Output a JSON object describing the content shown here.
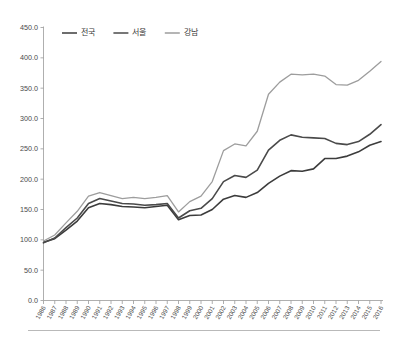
{
  "chart_data": {
    "type": "line",
    "title": "",
    "subtitle": "",
    "xlabel": "",
    "ylabel": "",
    "grid": false,
    "legend_position": "top-center",
    "ylim": [
      0.0,
      450.0
    ],
    "ytick_labels": [
      "0.0",
      "50.0",
      "100.0",
      "150.0",
      "200.0",
      "250.0",
      "300.0",
      "350.0",
      "400.0",
      "450.0"
    ],
    "ytick_values": [
      0,
      50,
      100,
      150,
      200,
      250,
      300,
      350,
      400,
      450
    ],
    "categories": [
      "1986",
      "1987",
      "1988",
      "1989",
      "1990",
      "1991",
      "1992",
      "1993",
      "1994",
      "1995",
      "1996",
      "1997",
      "1998",
      "1999",
      "2000",
      "2001",
      "2002",
      "2003",
      "2004",
      "2005",
      "2006",
      "2007",
      "2008",
      "2009",
      "2010",
      "2011",
      "2012",
      "2013",
      "2014",
      "2015",
      "2016"
    ],
    "series": [
      {
        "name": "전국",
        "color": "#3c3c3c",
        "width": 1.6,
        "values": [
          96,
          102,
          116,
          131,
          153,
          160,
          158,
          155,
          154,
          153,
          155,
          157,
          133,
          140,
          141,
          150,
          167,
          173,
          170,
          178,
          193,
          205,
          214,
          213,
          217,
          234,
          234,
          238,
          245,
          256,
          262
        ]
      },
      {
        "name": "서울",
        "color": "#4a4a4a",
        "width": 1.6,
        "values": [
          95,
          103,
          120,
          136,
          160,
          168,
          164,
          160,
          159,
          157,
          158,
          160,
          136,
          148,
          152,
          168,
          196,
          206,
          203,
          215,
          248,
          264,
          273,
          269,
          268,
          267,
          259,
          257,
          262,
          274,
          290
        ]
      },
      {
        "name": "강남",
        "color": "#9d9d9d",
        "width": 1.3,
        "values": [
          98,
          108,
          128,
          147,
          172,
          178,
          173,
          168,
          170,
          168,
          170,
          173,
          146,
          163,
          172,
          196,
          247,
          258,
          255,
          279,
          340,
          360,
          373,
          372,
          373,
          370,
          356,
          355,
          363,
          378,
          394
        ]
      }
    ],
    "legend": [
      {
        "label": "전국",
        "color": "#3c3c3c"
      },
      {
        "label": "서울",
        "color": "#4a4a4a"
      },
      {
        "label": "강남",
        "color": "#9d9d9d"
      }
    ]
  },
  "axes": {
    "y_axis_color": "#9a9a9a",
    "x_axis_color": "#9a9a9a"
  }
}
